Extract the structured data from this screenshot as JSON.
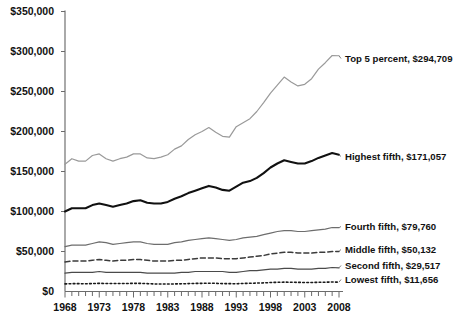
{
  "chart_data": {
    "type": "line",
    "title": "",
    "subtitle": "",
    "xlabel": "",
    "ylabel": "",
    "xlim": [
      1967,
      2008
    ],
    "ylim": [
      0,
      350000
    ],
    "grid": false,
    "legend_position": "right-inline-labels",
    "y_ticks": [
      0,
      50000,
      100000,
      150000,
      200000,
      250000,
      300000,
      350000
    ],
    "y_tick_labels": [
      "$0",
      "$50,000",
      "$100,000",
      "$150,000",
      "$200,000",
      "$250,000",
      "$300,000",
      "$350,000"
    ],
    "x_ticks": [
      1968,
      1973,
      1978,
      1983,
      1988,
      1993,
      1998,
      2003,
      2008
    ],
    "x_tick_labels": [
      "1968",
      "1973",
      "1978",
      "1983",
      "1988",
      "1993",
      "1998",
      "2003",
      "2008"
    ],
    "x_minor_tick_interval": 1,
    "x": [
      1968,
      1969,
      1970,
      1971,
      1972,
      1973,
      1974,
      1975,
      1976,
      1977,
      1978,
      1979,
      1980,
      1981,
      1982,
      1983,
      1984,
      1985,
      1986,
      1987,
      1988,
      1989,
      1990,
      1991,
      1992,
      1993,
      1994,
      1995,
      1996,
      1997,
      1998,
      1999,
      2000,
      2001,
      2002,
      2003,
      2004,
      2005,
      2006,
      2007,
      2008
    ],
    "series": [
      {
        "name": "Top 5 percent",
        "label": "Top 5 percent, $294,709",
        "end_value": 294709,
        "color": "#9a9a9a",
        "style": "solid",
        "width": 1.2,
        "label_y": 62,
        "values": [
          159000,
          166000,
          163000,
          163000,
          170000,
          172000,
          166000,
          163000,
          166000,
          168000,
          172000,
          172000,
          167000,
          166000,
          168000,
          171000,
          178000,
          182000,
          190000,
          196000,
          200000,
          205000,
          199000,
          194000,
          193000,
          206000,
          211000,
          216000,
          225000,
          236000,
          248000,
          258000,
          268000,
          262000,
          257000,
          259000,
          266000,
          278000,
          286000,
          295000,
          294709
        ]
      },
      {
        "name": "Highest fifth",
        "label": "Highest fifth, $171,057",
        "end_value": 171057,
        "color": "#111111",
        "style": "solid",
        "width": 2.1,
        "label_y": 160,
        "values": [
          100000,
          104000,
          104000,
          104000,
          108000,
          110000,
          108000,
          106000,
          108000,
          110000,
          113000,
          114000,
          111000,
          110000,
          110000,
          112000,
          116000,
          119000,
          123000,
          126000,
          129000,
          132000,
          130000,
          127000,
          126000,
          131000,
          136000,
          138000,
          142000,
          148000,
          155000,
          160000,
          164000,
          162000,
          160000,
          160000,
          163000,
          167000,
          170000,
          173000,
          171057
        ]
      },
      {
        "name": "Fourth fifth",
        "label": "Fourth fifth, $79,760",
        "end_value": 79760,
        "color": "#6d6d6d",
        "style": "solid",
        "width": 1.2,
        "label_y": 230,
        "values": [
          56000,
          58000,
          58000,
          58000,
          60000,
          62000,
          61000,
          59000,
          60000,
          61000,
          62000,
          62000,
          60000,
          59000,
          59000,
          59000,
          61000,
          62000,
          64000,
          65000,
          66000,
          67000,
          66000,
          65000,
          64000,
          65000,
          67000,
          68000,
          69000,
          71000,
          73000,
          75000,
          76000,
          76000,
          75000,
          75000,
          76000,
          77000,
          78000,
          80000,
          79760
        ]
      },
      {
        "name": "Middle fifth",
        "label": "Middle fifth, $50,132",
        "end_value": 50132,
        "color": "#3b3b3b",
        "style": "dashed",
        "width": 1.5,
        "label_y": 253,
        "values": [
          37000,
          38000,
          38000,
          38000,
          39000,
          40000,
          39000,
          38000,
          39000,
          39000,
          40000,
          40000,
          39000,
          38000,
          38000,
          38000,
          39000,
          39000,
          40000,
          41000,
          42000,
          42000,
          42000,
          41000,
          41000,
          41000,
          42000,
          43000,
          44000,
          45000,
          47000,
          48000,
          49000,
          49000,
          48000,
          48000,
          48000,
          49000,
          49000,
          50000,
          50132
        ]
      },
      {
        "name": "Second fifth",
        "label": "Second fifth, $29,517",
        "end_value": 29517,
        "color": "#4a4a4a",
        "style": "solid",
        "width": 1.2,
        "label_y": 269,
        "values": [
          23000,
          24000,
          24000,
          24000,
          24000,
          25000,
          24000,
          24000,
          24000,
          24000,
          24000,
          24000,
          23000,
          23000,
          23000,
          23000,
          23000,
          24000,
          24000,
          25000,
          25000,
          25000,
          25000,
          25000,
          24000,
          24000,
          25000,
          26000,
          26000,
          27000,
          28000,
          28000,
          29000,
          29000,
          28000,
          28000,
          28000,
          29000,
          29000,
          30000,
          29517
        ]
      },
      {
        "name": "Lowest fifth",
        "label": "Lowest fifth, $11,656",
        "end_value": 11656,
        "color": "#1a1a1a",
        "style": "dotted",
        "width": 1.6,
        "label_y": 283,
        "values": [
          9500,
          9800,
          9800,
          9700,
          9900,
          10200,
          10000,
          9900,
          10000,
          10000,
          10200,
          10200,
          9800,
          9500,
          9300,
          9300,
          9500,
          9600,
          9900,
          10100,
          10200,
          10400,
          10200,
          9900,
          9800,
          9700,
          10000,
          10300,
          10500,
          10800,
          11200,
          11500,
          11700,
          11600,
          11400,
          11300,
          11300,
          11500,
          11600,
          11900,
          11656
        ]
      }
    ]
  }
}
